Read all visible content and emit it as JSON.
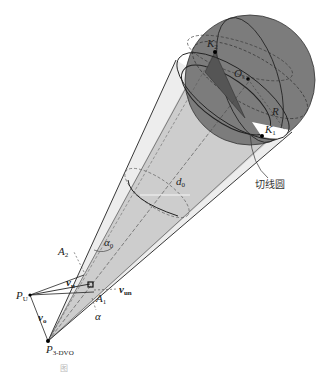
{
  "figure": {
    "type": "3D geometry diagram: collision cone from observer to spherical obstacle",
    "colors": {
      "sphere": "#7a7a7a",
      "sphere_dark_triangle": "#555555",
      "inner_cone": "#cfcfcf",
      "outer_cone": "#ececec",
      "line": "#222222"
    }
  },
  "labels": {
    "K2": {
      "main": "K",
      "sub": "2"
    },
    "K1": {
      "main": "K",
      "sub": "1"
    },
    "Os": {
      "main": "O",
      "sub": "s"
    },
    "R": {
      "main": "R"
    },
    "d0": {
      "main": "d",
      "sub": "0"
    },
    "alpha0": {
      "main": "α",
      "sub": "0"
    },
    "A2": {
      "main": "A",
      "sub": "2"
    },
    "A1": {
      "main": "A",
      "sub": "1"
    },
    "vu": {
      "main": "v",
      "sub": "u"
    },
    "vun": {
      "main": "v",
      "sub": "un"
    },
    "vo": {
      "main": "v",
      "sub": "o"
    },
    "alpha": {
      "main": "α"
    },
    "PU": {
      "main": "P",
      "sub": "U"
    },
    "P3DVO": {
      "main": "P",
      "sub": "3-DVO"
    },
    "tangent_circle": "切线圆"
  },
  "caption": "图"
}
